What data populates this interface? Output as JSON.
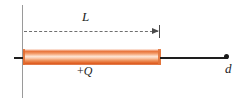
{
  "figure": {
    "type": "physics-diagram",
    "background_color": "#ffffff",
    "labels": {
      "length_label": "L",
      "charge_sign": "+",
      "charge_symbol": "Q",
      "distance_label": "d"
    },
    "elements": {
      "vertical_axis_name": "origin-reference-line",
      "dashed_measure_name": "length-measure-dashed-line",
      "rod_name": "charged-rod",
      "axis_name": "horizontal-axis",
      "field_point_name": "field-point"
    },
    "colors": {
      "rod_orange_dark": "#e0651f",
      "rod_orange_mid": "#ef9a63",
      "rod_highlight": "#fde3d2",
      "axis_black": "#1e1e1e",
      "guide_gray": "#9a9a9a",
      "dash_gray": "#6f6f6f",
      "text_color": "#1d1d1d"
    }
  }
}
